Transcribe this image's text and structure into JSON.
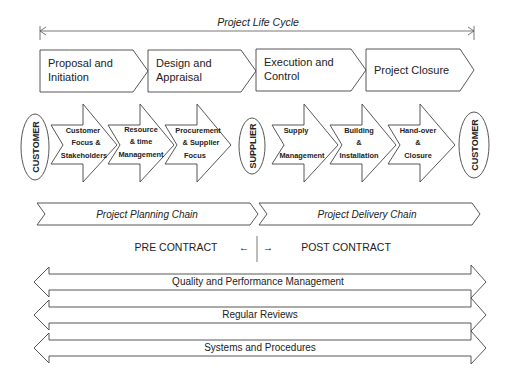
{
  "title": "Project Life Cycle",
  "phases": [
    {
      "lines": [
        "Proposal and",
        "Initiation"
      ]
    },
    {
      "lines": [
        "Design and",
        "Appraisal"
      ]
    },
    {
      "lines": [
        "Execution and",
        "Control"
      ]
    },
    {
      "lines": [
        "Project Closure"
      ]
    }
  ],
  "actors": {
    "customer_left": "CUSTOMER",
    "supplier": "SUPPLIER",
    "customer_right": "CUSTOMER"
  },
  "planning_steps": [
    {
      "lines": [
        "Customer",
        "Focus &",
        "Stakeholders"
      ]
    },
    {
      "lines": [
        "Resource",
        "& time",
        "Management"
      ]
    },
    {
      "lines": [
        "Procurement",
        "& Supplier",
        "Focus"
      ]
    }
  ],
  "delivery_steps": [
    {
      "lines": [
        "Supply",
        "",
        "Management"
      ]
    },
    {
      "lines": [
        "Building",
        "&",
        "Installation"
      ]
    },
    {
      "lines": [
        "Hand-over",
        "&",
        "Closure"
      ]
    }
  ],
  "chains": {
    "planning": "Project Planning Chain",
    "delivery": "Project Delivery Chain"
  },
  "contract": {
    "pre": "PRE CONTRACT",
    "post": "POST CONTRACT",
    "left_arrow": "←",
    "right_arrow": "→"
  },
  "bands": [
    "Quality and Performance Management",
    "Regular Reviews",
    "Systems and Procedures"
  ]
}
